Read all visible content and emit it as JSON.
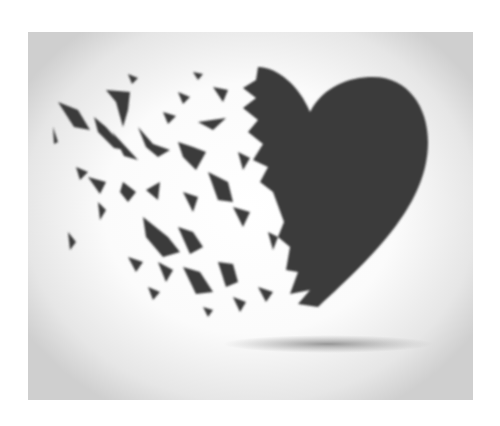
{
  "image": {
    "subject": "broken heart shattering into fragments",
    "colors": {
      "heart": "#3a3a3a",
      "background_center": "#ffffff",
      "background_edge": "#cfcfcf",
      "shadow": "#8a8a8a"
    }
  }
}
